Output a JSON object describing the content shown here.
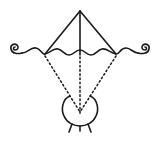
{
  "diagram": {
    "colors": {
      "stroke": "#1a1a1a",
      "background": "#ffffff"
    },
    "elements": [
      "triangle-apex",
      "wavy-line-with-spirals",
      "dotted-rays",
      "cauldron"
    ]
  }
}
